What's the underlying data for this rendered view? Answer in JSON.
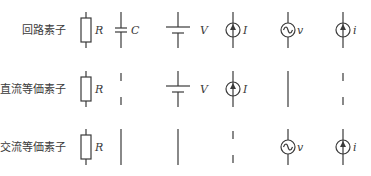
{
  "rows": [
    {
      "label": "回路素子",
      "elements": [
        {
          "type": "resistor",
          "symbol": "R"
        },
        {
          "type": "capacitor",
          "symbol": "C"
        },
        {
          "type": "dc-voltage-source",
          "symbol": "V"
        },
        {
          "type": "dc-current-source",
          "symbol": "I"
        },
        {
          "type": "ac-voltage-source",
          "symbol": "v"
        },
        {
          "type": "ac-current-source",
          "symbol": "i"
        }
      ]
    },
    {
      "label": "直流等価素子",
      "elements": [
        {
          "type": "resistor",
          "symbol": "R"
        },
        {
          "type": "open-circuit",
          "symbol": ""
        },
        {
          "type": "dc-voltage-source",
          "symbol": "V"
        },
        {
          "type": "dc-current-source",
          "symbol": "I"
        },
        {
          "type": "short-circuit",
          "symbol": ""
        },
        {
          "type": "open-circuit",
          "symbol": ""
        }
      ]
    },
    {
      "label": "交流等価素子",
      "elements": [
        {
          "type": "resistor",
          "symbol": "R"
        },
        {
          "type": "short-circuit",
          "symbol": ""
        },
        {
          "type": "short-circuit",
          "symbol": ""
        },
        {
          "type": "open-circuit",
          "symbol": ""
        },
        {
          "type": "ac-voltage-source",
          "symbol": "v"
        },
        {
          "type": "ac-current-source",
          "symbol": "i"
        }
      ]
    }
  ]
}
